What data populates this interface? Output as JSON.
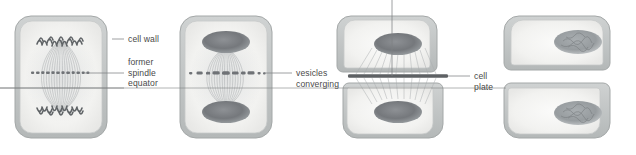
{
  "figure": {
    "background_color": "#ffffff",
    "line_color": "#8a8d90",
    "label_color": "#4a4a4a",
    "cell_wall_color": "#b9bdbd",
    "cytoplasm_color": "#f2f2f0",
    "chromatin_color": "#6e7275",
    "spindle_color": "#a8acae",
    "vesicle_color": "#6f7276",
    "cell_plate_color": "#5e6164"
  },
  "labels": [
    {
      "id": "cell-wall",
      "text": "cell wall",
      "lines": [
        "cell wall"
      ]
    },
    {
      "id": "former-spindle-equator",
      "text": "former spindle equator",
      "lines": [
        "former",
        "spindle",
        "equator"
      ]
    },
    {
      "id": "vesicles-converging",
      "text": "vesicles converging",
      "lines": [
        "vesicles",
        "converging"
      ]
    },
    {
      "id": "cell-plate",
      "text": "cell plate",
      "lines": [
        "cell",
        "plate"
      ]
    }
  ],
  "panels": [
    {
      "id": "panel-1",
      "stage": "Late anaphase / early telophase",
      "description": "Spindle fibers span the cell; chromosomes clustered at both poles; small vesicles aligned in a single row at the spindle equator.",
      "chromosome_state": "hairpin loops at poles",
      "vesicle_state": "small separate vesicles in a row",
      "vesicle_count": 17,
      "wall_state": "intact, unpinched"
    },
    {
      "id": "panel-2",
      "stage": "Telophase",
      "description": "Nuclei reforming as dense oval masses at the poles; vesicles fusing into larger clumps that spread beyond the spindle width.",
      "chromosome_state": "dense oval nuclear masses",
      "vesicle_state": "fusing into larger clumps",
      "vesicle_count": 11,
      "wall_state": "intact, unpinched"
    },
    {
      "id": "panel-3",
      "stage": "Cytokinesis — cell plate forming",
      "description": "A continuous dark cell plate spans the equator; residual fibers radiate from each nucleus toward the plate; the cell wall pinches inward at both sides.",
      "chromosome_state": "two oval nuclei",
      "vesicle_state": "fused into continuous cell plate",
      "wall_state": "pinched inward at sides"
    },
    {
      "id": "panel-4",
      "stage": "Two daughter cells",
      "description": "Division complete: two separate daughter cells, each with its own wall and a single mottled interphase nucleus.",
      "chromosome_state": "mottled interphase nuclei",
      "vesicle_state": "none",
      "wall_state": "complete new wall between daughter cells"
    }
  ]
}
